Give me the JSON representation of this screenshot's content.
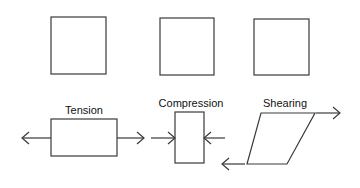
{
  "diagram": {
    "title": "",
    "colors": {
      "stroke": "#3a3a3a",
      "text": "#111111",
      "background": "#ffffff"
    },
    "top_row": [
      {
        "id": "square-1",
        "shape": "square",
        "x": 51,
        "y": 17,
        "w": 55,
        "h": 57
      },
      {
        "id": "square-2",
        "shape": "square",
        "x": 160,
        "y": 18,
        "w": 54,
        "h": 57
      },
      {
        "id": "square-3",
        "shape": "square",
        "x": 254,
        "y": 19,
        "w": 55,
        "h": 56
      }
    ],
    "bottom_row": [
      {
        "label": "Tension",
        "label_x": 84,
        "label_y": 104,
        "shape": "rectangle",
        "x": 51,
        "y": 119,
        "w": 66,
        "h": 37,
        "arrows": [
          {
            "from": [
              51,
              138
            ],
            "to": [
              22,
              138
            ],
            "direction": "left"
          },
          {
            "from": [
              117,
              138
            ],
            "to": [
              144,
              138
            ],
            "direction": "right"
          }
        ]
      },
      {
        "label": "Compression",
        "label_x": 191,
        "label_y": 98,
        "shape": "rectangle",
        "x": 175,
        "y": 112,
        "w": 29,
        "h": 51,
        "arrows": [
          {
            "from": [
              151,
              138
            ],
            "to": [
              175,
              138
            ],
            "direction": "right"
          },
          {
            "from": [
              225,
              138
            ],
            "to": [
              204,
              138
            ],
            "direction": "left"
          }
        ]
      },
      {
        "label": "Shearing",
        "label_x": 285,
        "label_y": 98,
        "shape": "parallelogram",
        "points": [
          [
            261,
            113
          ],
          [
            315,
            113
          ],
          [
            287,
            164
          ],
          [
            247,
            164
          ]
        ],
        "arrows": [
          {
            "from": [
              316,
              113
            ],
            "to": [
              340,
              113
            ],
            "direction": "right"
          },
          {
            "from": [
              245,
              164
            ],
            "to": [
              222,
              164
            ],
            "direction": "left"
          }
        ]
      }
    ]
  }
}
